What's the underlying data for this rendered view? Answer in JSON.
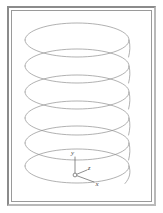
{
  "figure": {
    "background_color": "#ffffff",
    "frame": {
      "outer_border_color": "#8b8b8b",
      "outer_border_shadow_color": "#b9b9b9",
      "inner_border_color": "#9a9a9a"
    }
  },
  "coil": {
    "name": "helix",
    "stroke_color": "#8f8f8f",
    "stroke_width": 0.7,
    "turns": 6,
    "turn_centers_y": [
      32,
      58,
      84,
      110,
      136,
      158
    ],
    "ellipse_rx": 52,
    "ellipse_ry": 17,
    "center_x": 66,
    "lead_end_label": "wire-lead"
  },
  "axes": {
    "origin_x": 75,
    "origin_y": 165,
    "origin_marker": "circle",
    "origin_marker_color": "#6e6e6e",
    "stroke_color": "#5d5d5d",
    "labels": {
      "x": "x",
      "y": "y",
      "z": "z"
    }
  }
}
